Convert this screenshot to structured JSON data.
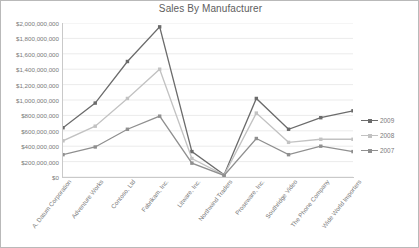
{
  "chart_data": {
    "type": "line",
    "title": "Sales By Manufacturer",
    "xlabel": "",
    "ylabel": "",
    "ylim": [
      0,
      2000000000
    ],
    "ytick_step": 200000000,
    "grid": true,
    "legend_position": "right",
    "ytick_labels": [
      "$2,000,000,000",
      "$1,800,000,000",
      "$1,600,000,000",
      "$1,400,000,000",
      "$1,200,000,000",
      "$1,000,000,000",
      "$800,000,000",
      "$600,000,000",
      "$400,000,000",
      "$200,000,000",
      "$0"
    ],
    "categories": [
      "A. Datum Corporation",
      "Adventure Works",
      "Contoso, Ltd",
      "Fabrikam, Inc.",
      "Litware, Inc.",
      "Northwind Traders",
      "Proseware, Inc.",
      "Southridge Video",
      "The Phone Company",
      "Wide World Importers"
    ],
    "series": [
      {
        "name": "2009",
        "color": "#6b6b6b",
        "values": [
          640000000,
          960000000,
          1500000000,
          1950000000,
          330000000,
          30000000,
          1020000000,
          620000000,
          770000000,
          860000000
        ]
      },
      {
        "name": "2008",
        "color": "#c2c2c2",
        "values": [
          470000000,
          660000000,
          1020000000,
          1400000000,
          240000000,
          25000000,
          830000000,
          450000000,
          490000000,
          490000000
        ]
      },
      {
        "name": "2007",
        "color": "#8f8f8f",
        "values": [
          290000000,
          390000000,
          620000000,
          790000000,
          180000000,
          20000000,
          500000000,
          290000000,
          400000000,
          330000000
        ]
      }
    ]
  },
  "legend": {
    "items": [
      "2009",
      "2008",
      "2007"
    ]
  }
}
